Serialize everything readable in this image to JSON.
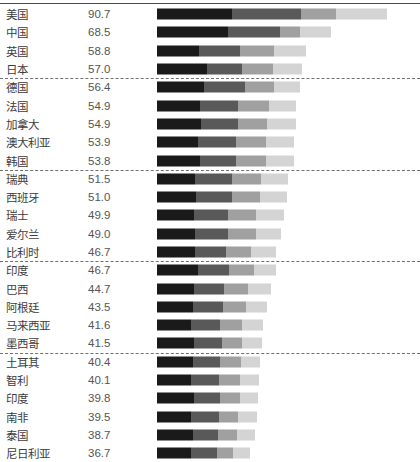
{
  "chart_data": {
    "type": "bar",
    "title": "",
    "subtitle": "",
    "xlabel": "",
    "ylabel": "",
    "orientation": "horizontal",
    "stacked": true,
    "grid": false,
    "legend": "none",
    "value_axis_max": 100,
    "categories": [
      "美国",
      "中国",
      "英国",
      "日本",
      "德国",
      "法国",
      "加拿大",
      "澳大利亚",
      "韩国",
      "瑞典",
      "西班牙",
      "瑞士",
      "爱尔兰",
      "比利时",
      "印度",
      "巴西",
      "阿根廷",
      "马来西亚",
      "墨西哥",
      "土耳其",
      "智利",
      "印度",
      "南非",
      "泰国",
      "尼日利亚"
    ],
    "values": [
      90.7,
      68.5,
      58.8,
      57.0,
      56.4,
      54.9,
      54.9,
      53.9,
      53.8,
      51.5,
      51.0,
      49.9,
      49.0,
      46.7,
      46.7,
      44.7,
      43.5,
      41.6,
      41.5,
      40.4,
      40.1,
      39.8,
      39.5,
      38.7,
      36.7
    ],
    "segment_colors": [
      "#1a1a1a",
      "#595959",
      "#a0a0a0",
      "#d4d4d4"
    ],
    "series": [
      {
        "name": "segment-1",
        "color": "#1a1a1a",
        "values": [
          29.5,
          28.0,
          16.5,
          19.5,
          18.5,
          17.0,
          17.5,
          16.0,
          17.0,
          15.0,
          15.5,
          14.5,
          15.0,
          15.0,
          16.0,
          14.5,
          14.0,
          13.5,
          14.5,
          14.0,
          13.5,
          14.5,
          13.5,
          14.0,
          13.5
        ]
      },
      {
        "name": "segment-2",
        "color": "#595959",
        "values": [
          27.0,
          20.5,
          16.0,
          14.0,
          16.0,
          15.0,
          14.5,
          15.0,
          14.0,
          14.5,
          14.0,
          13.5,
          13.0,
          12.0,
          12.5,
          12.0,
          12.0,
          11.5,
          11.0,
          11.0,
          11.0,
          10.5,
          11.0,
          10.0,
          10.0
        ]
      },
      {
        "name": "segment-3",
        "color": "#a0a0a0",
        "values": [
          14.0,
          8.0,
          13.5,
          12.0,
          11.5,
          12.0,
          11.5,
          12.0,
          12.0,
          11.5,
          11.0,
          11.0,
          11.0,
          10.0,
          9.5,
          9.5,
          9.0,
          8.5,
          8.0,
          8.0,
          8.0,
          7.5,
          7.5,
          7.5,
          6.5
        ]
      },
      {
        "name": "segment-4",
        "color": "#d4d4d4",
        "values": [
          20.2,
          12.0,
          12.8,
          11.5,
          10.4,
          10.9,
          11.4,
          10.9,
          10.8,
          10.5,
          10.5,
          10.9,
          10.0,
          9.7,
          8.7,
          8.7,
          8.5,
          8.1,
          8.0,
          7.4,
          7.6,
          7.3,
          7.5,
          7.2,
          6.7
        ]
      }
    ],
    "group_separators_after_rows": [
      4,
      9,
      14,
      19
    ]
  },
  "rows": [
    {
      "label": "美国",
      "value": "90.7"
    },
    {
      "label": "中国",
      "value": "68.5"
    },
    {
      "label": "英国",
      "value": "58.8"
    },
    {
      "label": "日本",
      "value": "57.0"
    },
    {
      "label": "德国",
      "value": "56.4"
    },
    {
      "label": "法国",
      "value": "54.9"
    },
    {
      "label": "加拿大",
      "value": "54.9"
    },
    {
      "label": "澳大利亚",
      "value": "53.9"
    },
    {
      "label": "韩国",
      "value": "53.8"
    },
    {
      "label": "瑞典",
      "value": "51.5"
    },
    {
      "label": "西班牙",
      "value": "51.0"
    },
    {
      "label": "瑞士",
      "value": "49.9"
    },
    {
      "label": "爱尔兰",
      "value": "49.0"
    },
    {
      "label": "比利时",
      "value": "46.7"
    },
    {
      "label": "印度",
      "value": "46.7"
    },
    {
      "label": "巴西",
      "value": "44.7"
    },
    {
      "label": "阿根廷",
      "value": "43.5"
    },
    {
      "label": "马来西亚",
      "value": "41.6"
    },
    {
      "label": "墨西哥",
      "value": "41.5"
    },
    {
      "label": "土耳其",
      "value": "40.4"
    },
    {
      "label": "智利",
      "value": "40.1"
    },
    {
      "label": "印度",
      "value": "39.8"
    },
    {
      "label": "南非",
      "value": "39.5"
    },
    {
      "label": "泰国",
      "value": "38.7"
    },
    {
      "label": "尼日利亚",
      "value": "36.7"
    }
  ]
}
